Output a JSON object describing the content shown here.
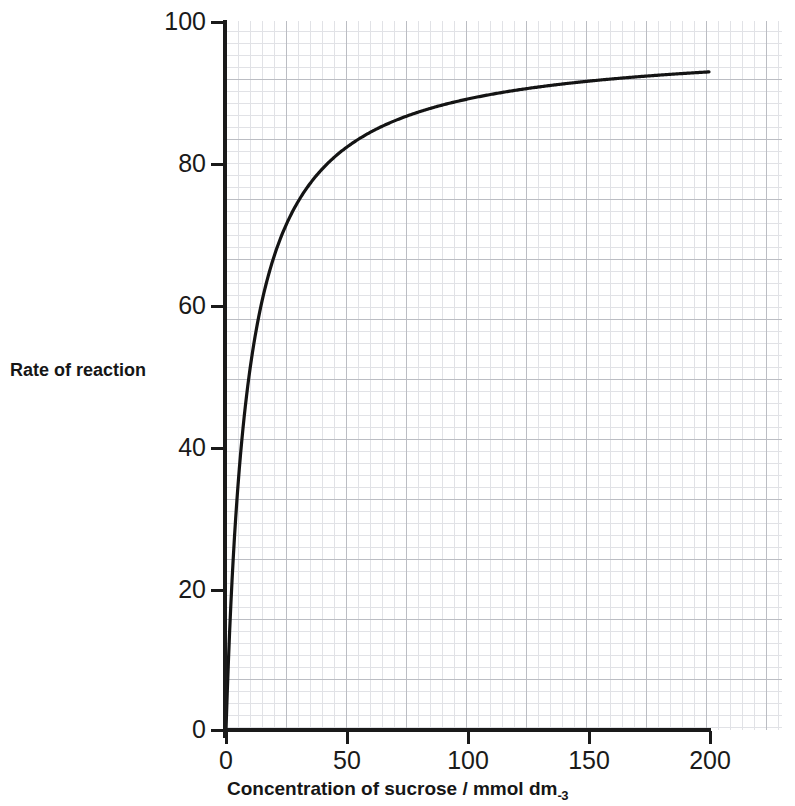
{
  "chart_data": {
    "type": "line",
    "title": "",
    "xlabel": "Concentration of sucrose / mmol dm",
    "xlabel_exponent": "-3",
    "ylabel": "Rate of reaction",
    "xlim": [
      0,
      200
    ],
    "ylim": [
      0,
      100
    ],
    "xticks": [
      0,
      50,
      100,
      150,
      200
    ],
    "xtick_labels": [
      "0",
      "50",
      "100",
      "150",
      "200"
    ],
    "yticks": [
      0,
      20,
      40,
      60,
      80,
      100
    ],
    "ytick_labels": [
      "0",
      "20",
      "40",
      "60",
      "80",
      "100"
    ],
    "grid": true,
    "grid_minor": true,
    "legend": false,
    "curve_description": "Enzyme-catalysed reaction rate rising steeply then levelling off (Michaelis-Menten saturation curve)",
    "series": [
      {
        "name": "Rate of reaction",
        "color": "#141414",
        "x": [
          0,
          1,
          2,
          3,
          4,
          5,
          6,
          8,
          10,
          12,
          15,
          18,
          21,
          25,
          30,
          35,
          40,
          45,
          50,
          60,
          70,
          80,
          90,
          100,
          110,
          120,
          130,
          140,
          150,
          160,
          170,
          180,
          190,
          200
        ],
        "y": [
          0,
          9.7,
          17.8,
          24.5,
          30.2,
          35.1,
          39.4,
          46.3,
          51.6,
          55.7,
          60.6,
          64.3,
          67.2,
          70.3,
          73.6,
          76.1,
          78.1,
          79.7,
          81.0,
          83.1,
          84.6,
          85.7,
          86.6,
          87.3,
          88.0,
          88.5,
          89.0,
          89.4,
          89.8,
          90.1,
          90.4,
          90.6,
          90.9,
          91.1
        ]
      }
    ],
    "model": {
      "form": "vmax*x/(km+x)",
      "vmax": 97.0,
      "km": 9.0
    }
  }
}
